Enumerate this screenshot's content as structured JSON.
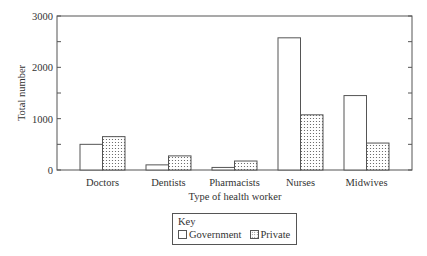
{
  "chart_data": {
    "type": "bar",
    "title": "",
    "xlabel": "Type of health worker",
    "ylabel": "Total number",
    "ylim": [
      0,
      3000
    ],
    "yticks": [
      0,
      1000,
      2000,
      3000
    ],
    "yminor_ticks": [
      500,
      1500,
      2500
    ],
    "grid": false,
    "legend_position": "bottom",
    "legend_title": "Key",
    "categories": [
      "Doctors",
      "Dentists",
      "Pharmacists",
      "Nurses",
      "Midwives"
    ],
    "series": [
      {
        "name": "Government",
        "pattern": "white",
        "values": [
          500,
          100,
          50,
          2575,
          1450
        ]
      },
      {
        "name": "Private",
        "pattern": "dotted",
        "values": [
          650,
          275,
          175,
          1075,
          525
        ]
      }
    ]
  },
  "axis": {
    "ytick_labels": [
      "0",
      "1000",
      "2000",
      "3000"
    ],
    "xlabel": "Type of health worker",
    "ylabel": "Total number"
  },
  "legend": {
    "title": "Key",
    "items": [
      {
        "label": "Government"
      },
      {
        "label": "Private"
      }
    ]
  },
  "colors": {
    "axis": "#555555",
    "bar_edge": "#555555",
    "bar_fill_government": "#ffffff",
    "dot_color": "#555555"
  }
}
